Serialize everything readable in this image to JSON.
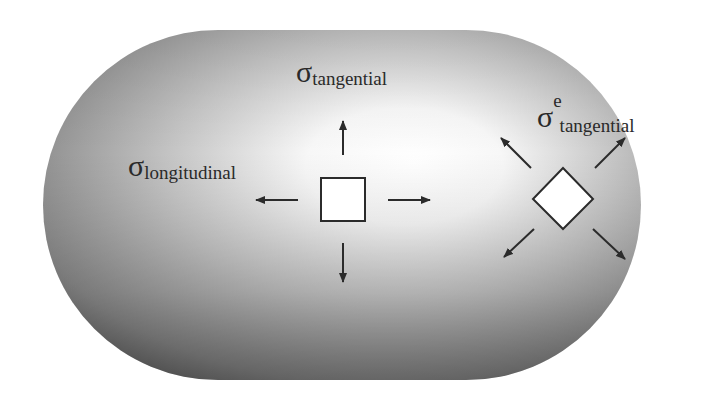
{
  "figure": {
    "shape": "capsule",
    "labels": {
      "tangential": {
        "symbol": "σ",
        "subscript": "tangential"
      },
      "longitudinal": {
        "symbol": "σ",
        "subscript": "longitudinal"
      },
      "effective_tangential": {
        "symbol": "σ",
        "superscript": "e",
        "subscript": "tangential"
      }
    },
    "elements": {
      "square_element": "axis-aligned stress element",
      "diamond_element": "rotated stress element"
    },
    "colors": {
      "surface_light": "#ffffff",
      "surface_dark": "#4a4a4a",
      "arrow": "#2b2b2b",
      "text": "#2a2a2a"
    }
  }
}
